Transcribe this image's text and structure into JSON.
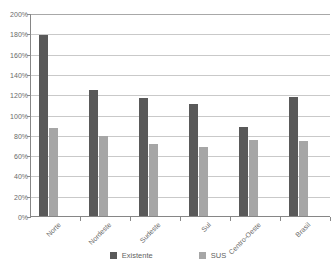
{
  "chart_data": {
    "type": "bar",
    "title": "",
    "subtitle": "",
    "xlabel": "",
    "ylabel": "",
    "categories": [
      "Norte",
      "Nordeste",
      "Sudeste",
      "Sul",
      "Centro-Oeste",
      "Brasil"
    ],
    "series": [
      {
        "name": "Existente",
        "color": "#595959",
        "values": [
          178,
          124,
          116,
          110,
          88,
          117
        ]
      },
      {
        "name": "SUS",
        "color": "#a6a6a6",
        "values": [
          87,
          79,
          71,
          68,
          75,
          74
        ]
      }
    ],
    "ylim": [
      0,
      200
    ],
    "ytick_step": 20,
    "ytick_labels": [
      "0%",
      "20%",
      "40%",
      "60%",
      "80%",
      "100%",
      "120%",
      "140%",
      "160%",
      "180%",
      "200%"
    ],
    "value_suffix": "%",
    "grid": true,
    "grid_axis": "y",
    "legend_position": "bottom",
    "xtick_label_rotation": -45
  },
  "legend": {
    "items": [
      {
        "label": "Existente",
        "color": "#595959"
      },
      {
        "label": "SUS",
        "color": "#a6a6a6"
      }
    ]
  },
  "colors": {
    "existente": "#595959",
    "sus": "#a6a6a6",
    "gridline": "#c9c9c9",
    "axis": "#868686",
    "text": "#6a6a6a",
    "background": "#ffffff"
  }
}
